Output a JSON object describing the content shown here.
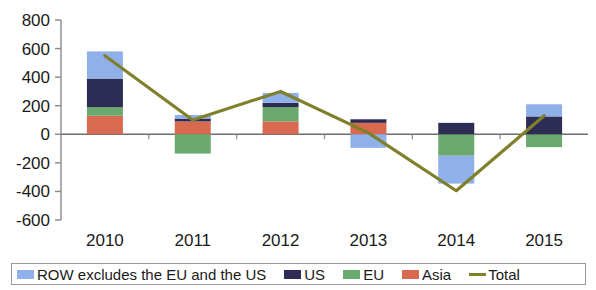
{
  "chart_data": {
    "type": "bar",
    "subtype": "stacked-bar-with-line",
    "title": "",
    "xlabel": "",
    "ylabel": "",
    "categories": [
      "2010",
      "2011",
      "2012",
      "2013",
      "2014",
      "2015"
    ],
    "ylim": [
      -600,
      800
    ],
    "ytick_values": [
      800,
      600,
      400,
      200,
      0,
      -200,
      -400,
      -600
    ],
    "ytick_labels": [
      "800",
      "600",
      "400",
      "200",
      "0",
      "-200",
      "-400",
      "-600"
    ],
    "grid": false,
    "legend_position": "bottom",
    "series": [
      {
        "name": "Asia",
        "key": "asia",
        "color": "#d9694f",
        "type": "bar-segment",
        "values": [
          130,
          90,
          90,
          80,
          0,
          0
        ]
      },
      {
        "name": "EU",
        "key": "eu",
        "color": "#6aa96e",
        "type": "bar-segment",
        "values": [
          60,
          -135,
          100,
          0,
          -150,
          -90
        ]
      },
      {
        "name": "US",
        "key": "us",
        "color": "#2c2c55",
        "type": "bar-segment",
        "values": [
          200,
          20,
          30,
          25,
          80,
          125
        ]
      },
      {
        "name": "ROW excludes the EU and the US",
        "key": "row",
        "color": "#8fb0e8",
        "type": "bar-segment",
        "values": [
          190,
          25,
          70,
          -95,
          -195,
          85
        ]
      },
      {
        "name": "Total",
        "key": "total",
        "color": "#80802b",
        "type": "line",
        "values": [
          550,
          100,
          300,
          10,
          -395,
          130
        ]
      }
    ]
  },
  "legend": {
    "items": [
      {
        "label": "ROW excludes the EU and the US",
        "color": "#8fb0e8",
        "marker": "swatch"
      },
      {
        "label": "US",
        "color": "#2c2c55",
        "marker": "swatch"
      },
      {
        "label": "EU",
        "color": "#6aa96e",
        "marker": "swatch"
      },
      {
        "label": "Asia",
        "color": "#d9694f",
        "marker": "swatch"
      },
      {
        "label": "Total",
        "color": "#80802b",
        "marker": "line"
      }
    ]
  },
  "axis": {
    "color": "#8a8a8a",
    "zero_line_color": "#6e6e6e"
  }
}
